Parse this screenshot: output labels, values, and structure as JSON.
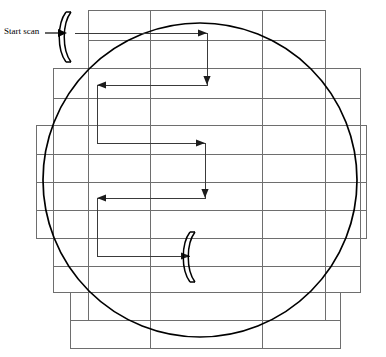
{
  "diagram": {
    "label_start_scan": "Start scan",
    "colors": {
      "grid_line": "#6e6e6e",
      "circle": "#000000",
      "path": "#3a3a3a",
      "lens": "#000000",
      "background": "#ffffff"
    },
    "wafer": {
      "shape": "circle",
      "center_x": 200,
      "center_y": 180,
      "radius": 157
    },
    "grid": {
      "row_boundaries_y": [
        10,
        40,
        68,
        98,
        125,
        154,
        182,
        210,
        238,
        266,
        292,
        320,
        348
      ],
      "rows": [
        {
          "index": 0,
          "y_top": 10,
          "y_bottom": 40,
          "x_left": 88,
          "x_right": 325
        },
        {
          "index": 1,
          "y_top": 40,
          "y_bottom": 68,
          "x_left": 88,
          "x_right": 325
        },
        {
          "index": 2,
          "y_top": 68,
          "y_bottom": 98,
          "x_left": 53,
          "x_right": 360
        },
        {
          "index": 3,
          "y_top": 98,
          "y_bottom": 125,
          "x_left": 53,
          "x_right": 360
        },
        {
          "index": 4,
          "y_top": 125,
          "y_bottom": 154,
          "x_left": 36,
          "x_right": 366
        },
        {
          "index": 5,
          "y_top": 154,
          "y_bottom": 182,
          "x_left": 36,
          "x_right": 366
        },
        {
          "index": 6,
          "y_top": 182,
          "y_bottom": 210,
          "x_left": 36,
          "x_right": 366
        },
        {
          "index": 7,
          "y_top": 210,
          "y_bottom": 238,
          "x_left": 36,
          "x_right": 366
        },
        {
          "index": 8,
          "y_top": 238,
          "y_bottom": 266,
          "x_left": 53,
          "x_right": 360
        },
        {
          "index": 9,
          "y_top": 266,
          "y_bottom": 292,
          "x_left": 53,
          "x_right": 360
        },
        {
          "index": 10,
          "y_top": 292,
          "y_bottom": 320,
          "x_left": 70,
          "x_right": 340
        },
        {
          "index": 11,
          "y_top": 320,
          "y_bottom": 348,
          "x_left": 70,
          "x_right": 340
        }
      ],
      "column_lines_x": [
        36,
        53,
        70,
        88,
        150,
        262,
        325,
        340,
        360,
        366
      ]
    },
    "scan_path": {
      "description": "Serpentine raster: right, down, left, down, right, down, left, down, right",
      "start_point": {
        "x": 75,
        "y": 33
      },
      "end_point": {
        "x": 190,
        "y": 256
      },
      "segments": [
        {
          "dir": "right",
          "x1": 75,
          "y1": 33,
          "x2": 207,
          "y2": 33
        },
        {
          "dir": "down",
          "x1": 207,
          "y1": 33,
          "x2": 207,
          "y2": 85
        },
        {
          "dir": "left",
          "x1": 207,
          "y1": 85,
          "x2": 97,
          "y2": 85
        },
        {
          "dir": "down",
          "x1": 97,
          "y1": 85,
          "x2": 97,
          "y2": 143
        },
        {
          "dir": "right",
          "x1": 97,
          "y1": 143,
          "x2": 205,
          "y2": 143
        },
        {
          "dir": "down",
          "x1": 205,
          "y1": 143,
          "x2": 205,
          "y2": 198
        },
        {
          "dir": "left",
          "x1": 205,
          "y1": 198,
          "x2": 97,
          "y2": 198
        },
        {
          "dir": "down",
          "x1": 97,
          "y1": 198,
          "x2": 97,
          "y2": 256
        },
        {
          "dir": "right",
          "x1": 97,
          "y1": 256,
          "x2": 190,
          "y2": 256
        }
      ],
      "arrowheads": [
        {
          "at_x": 207,
          "at_y": 33,
          "dir": "right"
        },
        {
          "at_x": 207,
          "at_y": 85,
          "dir": "down"
        },
        {
          "at_x": 97,
          "at_y": 143,
          "dir": "left"
        },
        {
          "at_x": 205,
          "at_y": 143,
          "dir": "right"
        },
        {
          "at_x": 205,
          "at_y": 198,
          "dir": "down"
        },
        {
          "at_x": 97,
          "at_y": 256,
          "dir": "left"
        },
        {
          "at_x": 190,
          "at_y": 256,
          "dir": "right"
        }
      ]
    },
    "lenses": [
      {
        "name": "start-lens",
        "x": 68,
        "y_top": 12,
        "y_bottom": 62,
        "bow": "left"
      },
      {
        "name": "end-lens",
        "x": 192,
        "y_top": 232,
        "y_bottom": 282,
        "bow": "left"
      }
    ],
    "start_arrow": {
      "x1": 45,
      "y1": 33,
      "x2": 66,
      "y2": 33
    }
  }
}
